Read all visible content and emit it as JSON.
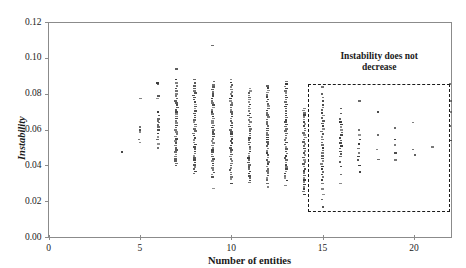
{
  "chart_data": {
    "type": "scatter",
    "title": "",
    "xlabel": "Number of entities",
    "ylabel": "Instability",
    "xlim": [
      0,
      22
    ],
    "ylim": [
      0.0,
      0.12
    ],
    "xticks": [
      0,
      5,
      10,
      15,
      20
    ],
    "xticklabels": [
      "0",
      "5",
      "10",
      "15",
      "20"
    ],
    "yticks": [
      0.0,
      0.02,
      0.04,
      0.06,
      0.08,
      0.1,
      0.12
    ],
    "yticklabels": [
      "0.00",
      "0.02",
      "0.04",
      "0.06",
      "0.08",
      "0.10",
      "0.12"
    ],
    "grid": false,
    "legend": null,
    "series": [
      {
        "name": "instability-by-entity-count",
        "points": [
          {
            "x": 4,
            "y": [
              0.0475
            ]
          },
          {
            "x": 5,
            "y": [
              0.0775,
              0.0615,
              0.06,
              0.0588,
              0.0545,
              0.053
            ]
          },
          {
            "x": 6,
            "y": [
              0.086,
              0.0855,
              0.079,
              0.0775,
              0.07,
              0.068,
              0.066,
              0.065,
              0.064,
              0.0628,
              0.0615,
              0.06,
              0.058,
              0.056,
              0.0545,
              0.0522,
              0.05
            ]
          },
          {
            "x": 7,
            "y": [
              0.094,
              0.088,
              0.086,
              0.0845,
              0.083,
              0.0815,
              0.08,
              0.0788,
              0.0775,
              0.0762,
              0.075,
              0.0738,
              0.0725,
              0.0712,
              0.07,
              0.0688,
              0.0675,
              0.0662,
              0.065,
              0.0638,
              0.0625,
              0.0612,
              0.06,
              0.0588,
              0.0575,
              0.0562,
              0.055,
              0.0538,
              0.0525,
              0.0512,
              0.05,
              0.0488,
              0.0475,
              0.0462,
              0.045,
              0.0438,
              0.0425,
              0.0412,
              0.04
            ]
          },
          {
            "x": 8,
            "y": [
              0.088,
              0.086,
              0.0845,
              0.083,
              0.0818,
              0.0805,
              0.0792,
              0.078,
              0.0768,
              0.0755,
              0.0742,
              0.073,
              0.0718,
              0.0705,
              0.0692,
              0.068,
              0.0668,
              0.0655,
              0.0642,
              0.063,
              0.0618,
              0.0605,
              0.0592,
              0.058,
              0.0568,
              0.0555,
              0.0542,
              0.053,
              0.0518,
              0.0505,
              0.0492,
              0.048,
              0.0468,
              0.0455,
              0.0442,
              0.043,
              0.0418,
              0.0405,
              0.0392,
              0.038,
              0.0368,
              0.0355
            ]
          },
          {
            "x": 9,
            "y": [
              0.107,
              0.087,
              0.085,
              0.0838,
              0.0825,
              0.0812,
              0.08,
              0.0788,
              0.0775,
              0.0762,
              0.075,
              0.0738,
              0.0725,
              0.0712,
              0.07,
              0.0688,
              0.0675,
              0.0662,
              0.065,
              0.0638,
              0.0625,
              0.0612,
              0.06,
              0.0588,
              0.0575,
              0.0562,
              0.055,
              0.0538,
              0.0525,
              0.0512,
              0.05,
              0.0488,
              0.0475,
              0.0462,
              0.045,
              0.0438,
              0.0425,
              0.0412,
              0.04,
              0.0388,
              0.0375,
              0.0362,
              0.035,
              0.0335,
              0.0272
            ]
          },
          {
            "x": 10,
            "y": [
              0.088,
              0.0865,
              0.085,
              0.0838,
              0.0825,
              0.0812,
              0.08,
              0.0788,
              0.0775,
              0.0762,
              0.075,
              0.0738,
              0.0725,
              0.0712,
              0.07,
              0.0688,
              0.0675,
              0.0662,
              0.065,
              0.0638,
              0.0625,
              0.0612,
              0.06,
              0.0588,
              0.0575,
              0.0562,
              0.055,
              0.0538,
              0.0525,
              0.0512,
              0.05,
              0.0488,
              0.0475,
              0.0462,
              0.045,
              0.0438,
              0.0425,
              0.0412,
              0.04,
              0.0388,
              0.0375,
              0.0362,
              0.035,
              0.0338,
              0.0325,
              0.03
            ]
          },
          {
            "x": 11,
            "y": [
              0.083,
              0.0818,
              0.0805,
              0.0792,
              0.078,
              0.0768,
              0.0755,
              0.0742,
              0.073,
              0.0718,
              0.0705,
              0.0692,
              0.068,
              0.0668,
              0.0655,
              0.0642,
              0.063,
              0.0618,
              0.0605,
              0.0592,
              0.058,
              0.0568,
              0.0555,
              0.0542,
              0.053,
              0.0518,
              0.0505,
              0.0492,
              0.048,
              0.0468,
              0.0455,
              0.0442,
              0.043,
              0.0418,
              0.0405,
              0.0392,
              0.038,
              0.0368,
              0.0355,
              0.0342,
              0.033,
              0.0318,
              0.0305
            ]
          },
          {
            "x": 12,
            "y": [
              0.0845,
              0.0832,
              0.082,
              0.0808,
              0.0795,
              0.0782,
              0.077,
              0.0758,
              0.0745,
              0.0732,
              0.072,
              0.0708,
              0.0695,
              0.0682,
              0.067,
              0.0658,
              0.0645,
              0.0632,
              0.062,
              0.0608,
              0.0595,
              0.0582,
              0.057,
              0.0558,
              0.0545,
              0.0532,
              0.052,
              0.0508,
              0.0495,
              0.0482,
              0.047,
              0.0458,
              0.0445,
              0.0432,
              0.042,
              0.0408,
              0.0395,
              0.0382,
              0.037,
              0.0358,
              0.0345,
              0.0332,
              0.032,
              0.03,
              0.028
            ]
          },
          {
            "x": 13,
            "y": [
              0.087,
              0.0855,
              0.0842,
              0.083,
              0.0818,
              0.0805,
              0.0792,
              0.078,
              0.0768,
              0.0755,
              0.0742,
              0.073,
              0.0718,
              0.0705,
              0.0692,
              0.068,
              0.0668,
              0.0655,
              0.0642,
              0.063,
              0.0618,
              0.0605,
              0.0592,
              0.058,
              0.0568,
              0.0555,
              0.0542,
              0.053,
              0.0518,
              0.0505,
              0.0492,
              0.048,
              0.0468,
              0.0455,
              0.0442,
              0.043,
              0.0418,
              0.0405,
              0.0392,
              0.038,
              0.0368,
              0.0355,
              0.0342,
              0.033,
              0.0318,
              0.029
            ]
          },
          {
            "x": 14,
            "y": [
              0.072,
              0.0708,
              0.0695,
              0.0682,
              0.067,
              0.0658,
              0.0645,
              0.0632,
              0.062,
              0.0608,
              0.0595,
              0.0582,
              0.057,
              0.0558,
              0.0545,
              0.0532,
              0.052,
              0.0508,
              0.0495,
              0.0482,
              0.047,
              0.0458,
              0.0445,
              0.0432,
              0.042,
              0.0408,
              0.0395,
              0.0382,
              0.037,
              0.0358,
              0.0345,
              0.0332,
              0.032,
              0.0308,
              0.0295,
              0.0282,
              0.027,
              0.0255,
              0.024
            ]
          },
          {
            "x": 15,
            "y": [
              0.084,
              0.08,
              0.078,
              0.076,
              0.074,
              0.0725,
              0.071,
              0.0695,
              0.068,
              0.0665,
              0.065,
              0.0635,
              0.062,
              0.0605,
              0.059,
              0.0575,
              0.056,
              0.0545,
              0.053,
              0.0515,
              0.05,
              0.0485,
              0.047,
              0.0455,
              0.044,
              0.0425,
              0.041,
              0.0395,
              0.038,
              0.0365,
              0.035,
              0.0335,
              0.032,
              0.03,
              0.027,
              0.024,
              0.021,
              0.017
            ]
          },
          {
            "x": 16,
            "y": [
              0.072,
              0.069,
              0.066,
              0.0645,
              0.063,
              0.0615,
              0.06,
              0.0585,
              0.057,
              0.0555,
              0.054,
              0.0525,
              0.051,
              0.0495,
              0.048,
              0.0465,
              0.045,
              0.042,
              0.0395,
              0.035,
              0.03
            ]
          },
          {
            "x": 17,
            "y": [
              0.076,
              0.06,
              0.057,
              0.0545,
              0.052,
              0.0495,
              0.047,
              0.045,
              0.043,
              0.04,
              0.0365
            ]
          },
          {
            "x": 18,
            "y": [
              0.07,
              0.057,
              0.049,
              0.0435
            ]
          },
          {
            "x": 19,
            "y": [
              0.061,
              0.0545,
              0.0515,
              0.047,
              0.043
            ]
          },
          {
            "x": 20,
            "y": [
              0.064,
              0.049,
              0.046
            ]
          },
          {
            "x": 21,
            "y": [
              0.0505
            ]
          },
          {
            "x": 22,
            "y": [
              0.0855,
              0.076,
              0.07,
              0.062,
              0.054
            ]
          }
        ]
      }
    ],
    "annotations": [
      {
        "name": "instability-does-not-decrease",
        "text": "Instability does not\ndecrease",
        "shape": "dashed-rectangle",
        "x_range": [
          14.2,
          22.0
        ],
        "y_range": [
          0.014,
          0.0855
        ]
      }
    ]
  }
}
